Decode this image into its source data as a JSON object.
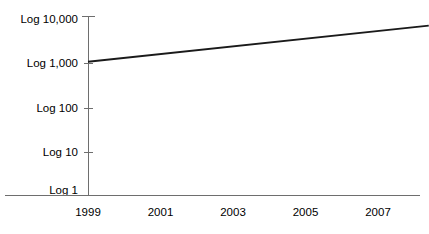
{
  "chart_data": {
    "type": "line",
    "title": "",
    "subtitle": "",
    "xlabel": "",
    "ylabel": "",
    "grid": false,
    "legend": false,
    "legend_position": "none",
    "y_scale": "log",
    "y_tick_labels": [
      "Log 10,000",
      "Log 1,000",
      "Log 100",
      "Log 10",
      "Log 1"
    ],
    "y_tick_values": [
      10000,
      1000,
      100,
      10,
      1
    ],
    "ylim": [
      1,
      10000
    ],
    "x_tick_labels": [
      "1999",
      "2001",
      "2003",
      "2005",
      "2007"
    ],
    "x_tick_values": [
      1999,
      2001,
      2003,
      2005,
      2007
    ],
    "xlim": [
      1999,
      2008.4
    ],
    "series": [
      {
        "name": "",
        "color": "#1a1a1a",
        "x": [
          1999,
          2008.4
        ],
        "values": [
          1000,
          7000
        ]
      }
    ]
  },
  "axes": {
    "y_axis_color": "#6e6e6e",
    "x_axis_color": "#6e6e6e",
    "line_color": "#1a1a1a",
    "background_color": "#ffffff"
  }
}
